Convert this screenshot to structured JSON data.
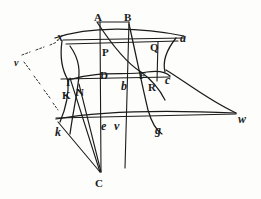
{
  "figure": {
    "style": "antique engraved line figure",
    "ink_color": "#1b1b1b",
    "paper_color": "#fdfdfc",
    "labels": [
      {
        "id": "A",
        "text": "A",
        "style": "roman",
        "x": 94,
        "y": 12
      },
      {
        "id": "B",
        "text": "B",
        "style": "roman",
        "x": 124,
        "y": 12
      },
      {
        "id": "x",
        "text": "x",
        "style": "italic",
        "x": 57,
        "y": 31
      },
      {
        "id": "a",
        "text": "a",
        "style": "italic",
        "x": 180,
        "y": 32
      },
      {
        "id": "Q",
        "text": "Q",
        "style": "roman",
        "x": 150,
        "y": 42
      },
      {
        "id": "P",
        "text": "P",
        "style": "roman",
        "x": 102,
        "y": 47
      },
      {
        "id": "v1",
        "text": "v",
        "style": "italic-sm",
        "x": 14,
        "y": 58
      },
      {
        "id": "D",
        "text": "D",
        "style": "roman",
        "x": 100,
        "y": 70
      },
      {
        "id": "F",
        "text": "F",
        "style": "roman",
        "x": 139,
        "y": 70
      },
      {
        "id": "c",
        "text": "c",
        "style": "italic",
        "x": 165,
        "y": 74
      },
      {
        "id": "I",
        "text": "I",
        "style": "roman",
        "x": 66,
        "y": 77
      },
      {
        "id": "b",
        "text": "b",
        "style": "italic",
        "x": 121,
        "y": 80
      },
      {
        "id": "R",
        "text": "R",
        "style": "roman",
        "x": 148,
        "y": 82
      },
      {
        "id": "N",
        "text": "N",
        "style": "roman",
        "x": 76,
        "y": 87
      },
      {
        "id": "K",
        "text": "K",
        "style": "roman",
        "x": 62,
        "y": 90
      },
      {
        "id": "w",
        "text": "w",
        "style": "italic",
        "x": 238,
        "y": 113
      },
      {
        "id": "e",
        "text": "e",
        "style": "italic",
        "x": 101,
        "y": 120
      },
      {
        "id": "v2",
        "text": "v",
        "style": "italic",
        "x": 114,
        "y": 120
      },
      {
        "id": "g",
        "text": "g",
        "style": "italic",
        "x": 155,
        "y": 124
      },
      {
        "id": "k",
        "text": "k",
        "style": "italic",
        "x": 55,
        "y": 126
      },
      {
        "id": "C",
        "text": "C",
        "style": "roman",
        "x": 95,
        "y": 178
      }
    ],
    "strokes": [
      {
        "id": "top-bar-AB",
        "kind": "line",
        "d": "M 98 22 L 129 22"
      },
      {
        "id": "left-vert-A-C",
        "kind": "line",
        "d": "M 100 22 L 101 172"
      },
      {
        "id": "right-vert-B-C",
        "kind": "line",
        "d": "M 129 22 L 125 168"
      },
      {
        "id": "upper-horiz-xa",
        "kind": "line",
        "d": "M 63 40 L 184 38"
      },
      {
        "id": "upper-horiz-P",
        "kind": "line",
        "d": "M 66 44 L 178 41"
      },
      {
        "id": "mid-horiz-DR",
        "kind": "line",
        "d": "M 61 79 L 170 77"
      },
      {
        "id": "low-horiz-kw",
        "kind": "line",
        "d": "M 56 118 L 236 114"
      },
      {
        "id": "right-vert-QR",
        "kind": "line",
        "d": "M 158 42 L 157 81"
      },
      {
        "id": "ray-I-C",
        "kind": "line",
        "d": "M 70 78 L 100 172"
      },
      {
        "id": "ray-k-C",
        "kind": "line",
        "d": "M 58 122 L 100 172"
      },
      {
        "id": "ray-N-C",
        "kind": "line",
        "d": "M 79 84 L 101 172"
      },
      {
        "id": "curve-x-a",
        "kind": "curve",
        "d": "M 55 38 C 90 26 140 27 184 36"
      },
      {
        "id": "curve-I-left",
        "kind": "curve",
        "d": "M 62 41 C 60 55 62 70 68 80"
      },
      {
        "id": "curve-k-branch",
        "kind": "curve",
        "d": "M 68 80 C 69 95 66 108 60 122"
      },
      {
        "id": "curve-N-branch",
        "kind": "curve",
        "d": "M 70 46 C 80 60 80 72 78 84 C 76 100 73 112 70 134"
      },
      {
        "id": "curve-D-F-main",
        "kind": "curve",
        "d": "M 68 80 C 100 70 126 76 147 72 C 160 70 166 72 170 76"
      },
      {
        "id": "curve-b-up",
        "kind": "curve",
        "d": "M 97 22 C 112 45 128 64 141 72 C 152 80 160 90 165 100"
      },
      {
        "id": "curve-g-down",
        "kind": "curve",
        "d": "M 129 24 C 136 55 142 85 148 110 C 152 124 156 130 162 134"
      },
      {
        "id": "curve-c-w",
        "kind": "curve",
        "d": "M 166 70 C 186 82 208 100 236 113"
      },
      {
        "id": "curve-c-hook",
        "kind": "curve",
        "d": "M 176 38 C 168 48 162 60 165 72"
      },
      {
        "id": "curve-low-kw",
        "kind": "curve",
        "d": "M 56 119 C 100 111 170 110 236 113"
      },
      {
        "id": "dash-v-x",
        "kind": "dash",
        "d": "M 22 55 L 30 52 M 36 50 L 44 47 M 50 45 L 57 42"
      },
      {
        "id": "dash-v-k",
        "kind": "dash",
        "d": "M 24 62 L 30 70 M 34 76 L 40 84 M 44 90 L 50 98 M 53 103 L 58 110"
      }
    ]
  }
}
